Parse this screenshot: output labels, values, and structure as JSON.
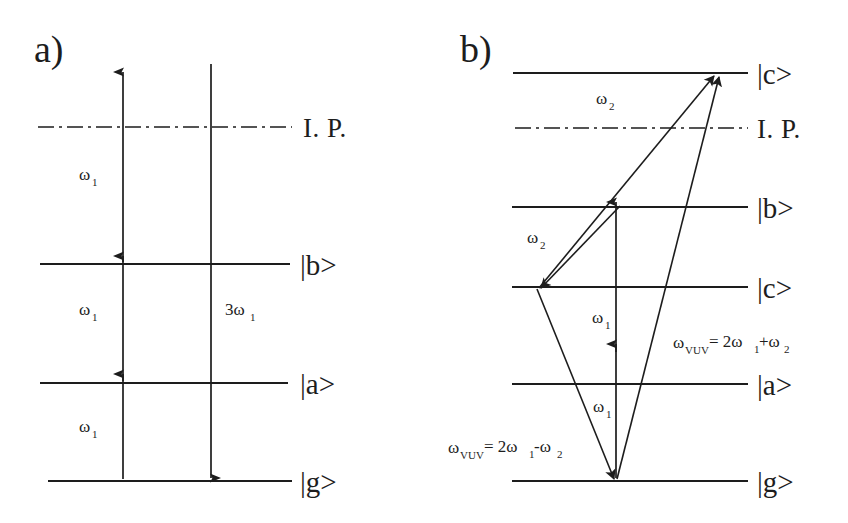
{
  "figure": {
    "background_color": "#ffffff",
    "ink_color": "#1d1d1d",
    "width": 848,
    "height": 523
  },
  "panels": [
    {
      "id": "a",
      "letter": "a)",
      "description": "Three-photon resonant third harmonic generation scheme",
      "levels": [
        {
          "id": "ip",
          "label": "I. P.",
          "style": "dash-dot",
          "y": 127
        },
        {
          "id": "b",
          "label": "|b>",
          "style": "solid",
          "y": 264
        },
        {
          "id": "a",
          "label": "|a>",
          "style": "solid",
          "y": 383
        },
        {
          "id": "g",
          "label": "|g>",
          "style": "solid",
          "y": 481
        }
      ],
      "transitions": [
        {
          "id": "w1-lower",
          "label": "ω",
          "sub": "1",
          "direction": "up",
          "from": "g",
          "to": "a"
        },
        {
          "id": "w1-middle",
          "label": "ω",
          "sub": "1",
          "direction": "up",
          "from": "a",
          "to": "b"
        },
        {
          "id": "w1-upper",
          "label": "ω",
          "sub": "1",
          "direction": "up",
          "from": "b",
          "to": "above-ip"
        },
        {
          "id": "3w1",
          "label": "3ω",
          "sub": "1",
          "direction": "down",
          "from": "above-ip",
          "to": "g"
        }
      ]
    },
    {
      "id": "b",
      "letter": "b)",
      "description": "Four-wave mixing schemes producing VUV at 2w1+w2 and 2w1-w2",
      "levels": [
        {
          "id": "c-upper",
          "label": "|c>",
          "style": "solid",
          "y": 73
        },
        {
          "id": "ip",
          "label": "I. P.",
          "style": "dash-dot",
          "y": 128
        },
        {
          "id": "b",
          "label": "|b>",
          "style": "solid",
          "y": 207
        },
        {
          "id": "c-lower",
          "label": "|c>",
          "style": "solid",
          "y": 287
        },
        {
          "id": "a",
          "label": "|a>",
          "style": "solid",
          "y": 384
        },
        {
          "id": "g",
          "label": "|g>",
          "style": "solid",
          "y": 481
        }
      ],
      "transitions": [
        {
          "id": "w2-upper",
          "label": "ω",
          "sub": "2",
          "direction": "up",
          "from": "c-lower",
          "to": "c-upper"
        },
        {
          "id": "w2-lower",
          "label": "ω",
          "sub": "2",
          "direction": "down",
          "from": "b-cross",
          "to": "c-lower"
        },
        {
          "id": "w1-upper-vertical",
          "label": "ω",
          "sub": "1",
          "direction": "up",
          "from": "mid",
          "to": "b"
        },
        {
          "id": "w1-lower-vertical",
          "label": "ω",
          "sub": "1",
          "direction": "up",
          "from": "g",
          "to": "mid"
        },
        {
          "id": "vuv-sum-arrow",
          "direction": "up",
          "from": "g",
          "to": "c-upper"
        },
        {
          "id": "vuv-difference-arrow",
          "direction": "down",
          "from": "c-lower",
          "to": "g"
        }
      ],
      "formulas": [
        {
          "id": "vuv-sum",
          "prefix": "ω",
          "prefix_sub": "VUV",
          "body": "= 2ω",
          "body_sub": "1",
          "tail": "+ω",
          "tail_sub": "2",
          "text": "ω_VUV= 2ω₁+ω₂"
        },
        {
          "id": "vuv-difference",
          "prefix": "ω",
          "prefix_sub": "VUV",
          "body": "= 2ω",
          "body_sub": "1",
          "tail": "-ω",
          "tail_sub": "2",
          "text": "ω_VUV= 2ω₁-ω₂"
        }
      ]
    }
  ]
}
